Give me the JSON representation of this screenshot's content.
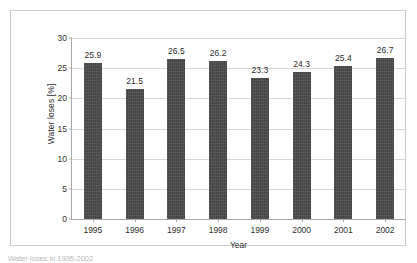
{
  "chart_data": {
    "type": "bar",
    "title": "",
    "xlabel": "Year",
    "ylabel": "Water loses [%]",
    "categories": [
      "1995",
      "1996",
      "1997",
      "1998",
      "1999",
      "2000",
      "2001",
      "2002"
    ],
    "values": [
      25.9,
      21.5,
      26.5,
      26.2,
      23.3,
      24.3,
      25.4,
      26.7
    ],
    "value_labels": [
      "25.9",
      "21.5",
      "26.5",
      "26.2",
      "23.3",
      "24.3",
      "25.4",
      "26.7"
    ],
    "ylim": [
      0,
      30
    ],
    "yticks": [
      0,
      5,
      10,
      15,
      20,
      25,
      30
    ],
    "ytick_labels": [
      "0",
      "5",
      "10",
      "15",
      "20",
      "25",
      "30"
    ],
    "grid": true,
    "legend": "none",
    "bar_color": "#4c4c4c",
    "gridline_color": "#d6d6d6",
    "axis_color": "#a8a8a8",
    "frame_color": "#c9c9c9",
    "background": "#ffffff"
  },
  "caption": "Water loses in 1995-2002"
}
